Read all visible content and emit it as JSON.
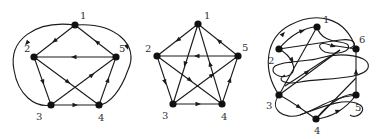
{
  "figure": {
    "background": "#ffffff",
    "ink_color": "#1a1a1a",
    "graphs": [
      {
        "name": "graph-left",
        "nodes": [
          {
            "id": "1",
            "x": 75,
            "y": 25,
            "lx": 80,
            "ly": 19
          },
          {
            "id": "2",
            "x": 34,
            "y": 57,
            "lx": 24,
            "ly": 52
          },
          {
            "id": "3",
            "x": 51,
            "y": 105,
            "lx": 36,
            "ly": 120
          },
          {
            "id": "4",
            "x": 99,
            "y": 105,
            "lx": 98,
            "ly": 121
          },
          {
            "id": "5",
            "x": 116,
            "y": 57,
            "lx": 119,
            "ly": 52
          }
        ],
        "edges": [
          {
            "d": "M75,25 L34,57",
            "ax": 54.5,
            "ay": 41,
            "angle": 142
          },
          {
            "d": "M75,25 L116,57",
            "ax": 97,
            "ay": 42,
            "angle": 218
          },
          {
            "d": "M116,57 L34,57",
            "ax": 74,
            "ay": 57,
            "angle": 180
          },
          {
            "d": "M34,57 L51,105",
            "ax": 43,
            "ay": 82,
            "angle": 71
          },
          {
            "d": "M34,57 L99,105",
            "ax": 68,
            "ay": 82,
            "angle": 36
          },
          {
            "d": "M51,105 L116,57",
            "ax": 92,
            "ay": 75,
            "angle": -36
          },
          {
            "d": "M51,105 L99,105",
            "ax": 75,
            "ay": 105,
            "angle": 0
          },
          {
            "d": "M99,105 L116,57",
            "ax": 108,
            "ay": 80,
            "angle": -71
          },
          {
            "d": "M75,25 C35,20 8,40 14,70 C18,95 35,108 51,105",
            "ax": 27,
            "ay": 43,
            "angle": 130
          },
          {
            "d": "M75,25 C115,22 140,45 128,70 C121,90 110,104 99,105",
            "ax": 127,
            "ay": 47,
            "angle": 70
          }
        ]
      },
      {
        "name": "graph-middle",
        "nodes": [
          {
            "id": "1",
            "x": 198,
            "y": 24,
            "lx": 204,
            "ly": 19
          },
          {
            "id": "2",
            "x": 157,
            "y": 56,
            "lx": 145,
            "ly": 52
          },
          {
            "id": "3",
            "x": 173,
            "y": 104,
            "lx": 162,
            "ly": 119
          },
          {
            "id": "4",
            "x": 222,
            "y": 104,
            "lx": 221,
            "ly": 120
          },
          {
            "id": "5",
            "x": 238,
            "y": 56,
            "lx": 242,
            "ly": 51
          }
        ],
        "edges": [
          {
            "d": "M198,24 L157,56",
            "ax": 178,
            "ay": 40,
            "angle": 142
          },
          {
            "d": "M238,56 L198,24",
            "ax": 219,
            "ay": 41,
            "angle": 219
          },
          {
            "d": "M238,56 L157,56",
            "ax": 197,
            "ay": 56,
            "angle": 180
          },
          {
            "d": "M157,56 L173,104",
            "ax": 165,
            "ay": 82,
            "angle": 72
          },
          {
            "d": "M157,56 L222,104",
            "ax": 190,
            "ay": 80,
            "angle": 36
          },
          {
            "d": "M173,104 L238,56",
            "ax": 212,
            "ay": 75,
            "angle": -36
          },
          {
            "d": "M173,104 L222,104",
            "ax": 198,
            "ay": 104,
            "angle": 0
          },
          {
            "d": "M222,104 L238,56",
            "ax": 230,
            "ay": 80,
            "angle": -72
          },
          {
            "d": "M198,24 L173,104",
            "ax": 185,
            "ay": 64,
            "angle": 107
          },
          {
            "d": "M222,104 L198,24",
            "ax": 210,
            "ay": 64,
            "angle": -107
          }
        ]
      },
      {
        "name": "graph-right",
        "nodes": [
          {
            "id": "1",
            "x": 317,
            "y": 27,
            "lx": 323,
            "ly": 23
          },
          {
            "id": "2",
            "x": 279,
            "y": 49,
            "lx": 268,
            "ly": 64
          },
          {
            "id": "3",
            "x": 279,
            "y": 95,
            "lx": 266,
            "ly": 109
          },
          {
            "id": "4",
            "x": 316,
            "y": 119,
            "lx": 314,
            "ly": 134
          },
          {
            "id": "5",
            "x": 356,
            "y": 95,
            "lx": 355,
            "ly": 111
          },
          {
            "id": "6",
            "x": 356,
            "y": 49,
            "lx": 359,
            "ly": 43
          }
        ],
        "edges": [
          {
            "d": "M279,95 C262,70 265,38 290,25 C315,12 345,15 356,49",
            "ax": 283,
            "ay": 34,
            "angle": -50
          },
          {
            "d": "M279,49 C290,35 305,27 317,27",
            "ax": 302,
            "ay": 31,
            "angle": -15
          },
          {
            "d": "M317,27 L279,95",
            "ax": 0,
            "ay": 0,
            "angle": 0
          },
          {
            "d": "M317,27 C322,45 345,40 348,45 C352,52 336,55 325,52 C318,49 316,40 330,45 L356,49",
            "ax": 333,
            "ay": 46,
            "angle": 20
          },
          {
            "d": "M279,49 L340,40 C355,38 358,45 350,48",
            "ax": 0,
            "ay": 0,
            "angle": 0
          },
          {
            "d": "M279,49 C292,56 298,70 290,75 C280,80 268,72 275,66 C285,60 310,62 320,58 C340,52 372,55 368,68 C364,80 320,78 300,82 C285,85 275,80 285,75",
            "ax": 292,
            "ay": 60,
            "angle": 60
          },
          {
            "d": "M279,95 L340,50",
            "ax": 0,
            "ay": 0,
            "angle": 0
          },
          {
            "d": "M285,86 L340,50",
            "ax": 307,
            "ay": 72,
            "angle": -36
          },
          {
            "d": "M356,95 L356,49",
            "ax": 356,
            "ay": 72,
            "angle": -90
          },
          {
            "d": "M279,95 C290,100 300,108 316,119",
            "ax": 299,
            "ay": 107,
            "angle": 32
          },
          {
            "d": "M279,95 C268,110 285,120 300,115 C320,108 330,98 356,95",
            "ax": 0,
            "ay": 0,
            "angle": 0
          },
          {
            "d": "M316,119 C330,118 345,110 356,95",
            "ax": 338,
            "ay": 111,
            "angle": -20
          },
          {
            "d": "M316,119 L356,78",
            "ax": 0,
            "ay": 0,
            "angle": 0
          },
          {
            "d": "M316,119 C330,100 350,92 356,95",
            "ax": 0,
            "ay": 0,
            "angle": 0
          },
          {
            "d": "M300,115 C320,108 345,96 360,105 C368,110 356,120 350,115",
            "ax": 0,
            "ay": 0,
            "angle": 0
          }
        ]
      }
    ]
  }
}
